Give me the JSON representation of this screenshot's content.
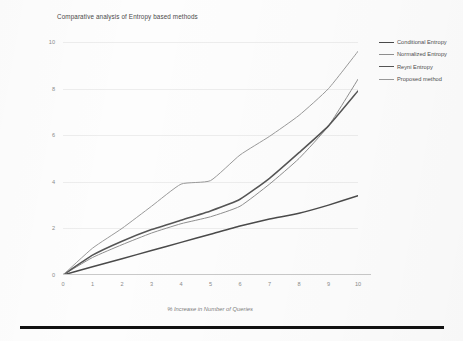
{
  "chart_data": {
    "type": "line",
    "title": "Comparative analysis of Entropy based methods",
    "xlabel": "% Increase in Number of Queries",
    "ylabel": "% Increase in Entropy",
    "xlim": [
      0,
      10
    ],
    "ylim": [
      0,
      10
    ],
    "xticks": [
      "0",
      "1",
      "2",
      "3",
      "4",
      "5",
      "6",
      "7",
      "8",
      "9",
      "10"
    ],
    "yticks": [
      "0",
      "2",
      "4",
      "6",
      "8",
      "10"
    ],
    "grid": "horizontal",
    "legend_position": "right",
    "x": [
      0,
      1,
      2,
      3,
      4,
      5,
      6,
      7,
      8,
      9,
      10
    ],
    "series": [
      {
        "name": "Conditional Entropy",
        "color": "#4a4a4a",
        "width": 1.5,
        "values": [
          0,
          0.35,
          0.7,
          1.05,
          1.4,
          1.75,
          2.1,
          2.4,
          2.65,
          3.0,
          3.4
        ]
      },
      {
        "name": "Normalized Entropy",
        "color": "#8f8f8f",
        "width": 1.0,
        "values": [
          0,
          0.75,
          1.3,
          1.8,
          2.2,
          2.5,
          2.95,
          3.9,
          5.0,
          6.4,
          8.4
        ]
      },
      {
        "name": "Reyni Entropy",
        "color": "#555555",
        "width": 1.5,
        "values": [
          0,
          0.85,
          1.45,
          1.95,
          2.35,
          2.75,
          3.25,
          4.15,
          5.25,
          6.4,
          7.9
        ]
      },
      {
        "name": "Proposed method",
        "color": "#9a9a9a",
        "width": 1.0,
        "values": [
          0,
          1.15,
          2.0,
          2.95,
          3.9,
          4.05,
          5.15,
          5.95,
          6.85,
          8.0,
          9.6
        ]
      }
    ]
  }
}
